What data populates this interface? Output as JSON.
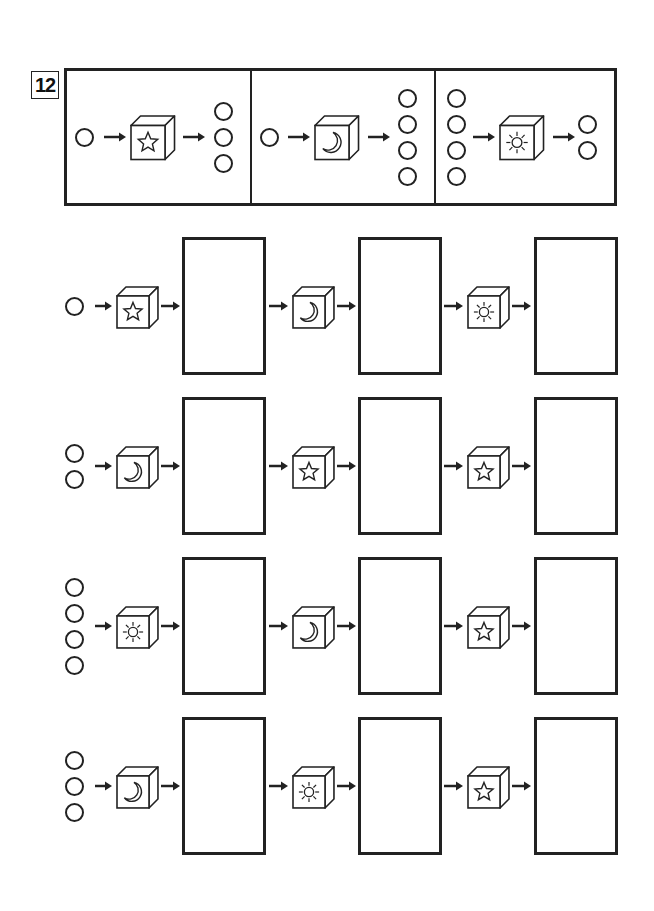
{
  "problem_number": "12",
  "legend": {
    "examples": [
      {
        "input_circles": 1,
        "box_icon": "star",
        "output_circles": 3
      },
      {
        "input_circles": 1,
        "box_icon": "moon",
        "output_circles": 4
      },
      {
        "input_circles": 4,
        "box_icon": "sun",
        "output_circles": 2
      }
    ]
  },
  "rows": [
    {
      "input_circles": 1,
      "boxes": [
        "star",
        "moon",
        "sun"
      ],
      "answers": [
        "",
        "",
        ""
      ]
    },
    {
      "input_circles": 2,
      "boxes": [
        "moon",
        "star",
        "star"
      ],
      "answers": [
        "",
        "",
        ""
      ]
    },
    {
      "input_circles": 4,
      "boxes": [
        "sun",
        "moon",
        "star"
      ],
      "answers": [
        "",
        "",
        ""
      ]
    },
    {
      "input_circles": 3,
      "boxes": [
        "moon",
        "sun",
        "star"
      ],
      "answers": [
        "",
        "",
        ""
      ]
    }
  ],
  "colors": {
    "ink": "#222222",
    "background": "#ffffff"
  }
}
